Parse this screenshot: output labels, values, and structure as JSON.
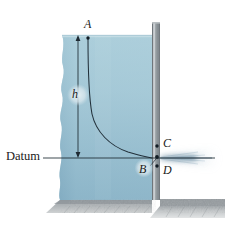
{
  "figure": {
    "name": "tank-orifice-streamline-diagram",
    "labels": {
      "point_a": "A",
      "point_b": "B",
      "point_c": "C",
      "point_d": "D",
      "height": "h",
      "datum": "Datum"
    },
    "colors": {
      "water_top": "#a9ccd9",
      "water_bottom": "#79a6bd",
      "wall_gray": "#8c9296",
      "wall_highlight": "#c2c8cb",
      "ground_gray": "#a8adb0",
      "line_dark": "#1e2a33",
      "jet_spray": "#7c9fb4",
      "background": "#ffffff"
    },
    "geometry": {
      "water_surface_y": 35,
      "datum_y": 158,
      "orifice_x": 152,
      "wall_x": 152,
      "wall_width": 8,
      "dimension_line_x": 78,
      "ground_top_y": 200
    }
  }
}
